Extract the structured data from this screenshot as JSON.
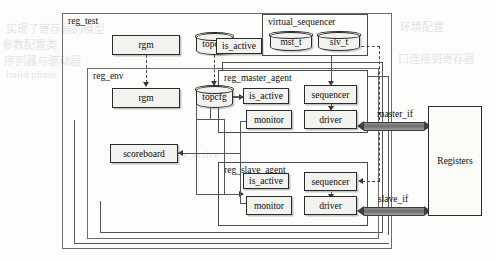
{
  "diagram": {
    "title": "reg_test",
    "containers": [
      {
        "id": "reg_test",
        "label": "reg_test"
      },
      {
        "id": "reg_env",
        "label": "reg_env"
      },
      {
        "id": "virtual_sequencer",
        "label": "virtual_sequencer"
      },
      {
        "id": "reg_master_agent",
        "label": "reg_master_agent"
      },
      {
        "id": "reg_slave_agent",
        "label": "reg_slave_agent"
      }
    ],
    "nodes": {
      "test_rgm": "rgm",
      "test_topcfg": "topcfg",
      "test_is_active": "is_active",
      "env_rgm": "rgm",
      "env_topcfg": "topcfg",
      "vseq_mst": "mst_t",
      "vseq_slv": "slv_t",
      "scoreboard": "scoreboard",
      "master_is_active": "is_active",
      "master_sequencer": "sequencer",
      "master_monitor": "monitor",
      "master_driver": "driver",
      "slave_is_active": "is_active",
      "slave_sequencer": "sequencer",
      "slave_monitor": "monitor",
      "slave_driver": "driver",
      "registers": "Registers"
    },
    "interfaces": {
      "master_if": "master_if",
      "slave_if": "slave_if"
    },
    "colors": {
      "node_fill": "#f2f2ee",
      "node_stroke": "#2b2b2b",
      "container_stroke": "#6b6b6b",
      "bus": "#6d6d6d",
      "page": "#fdfdfb"
    },
    "background_text": [
      "实现了寄存器的模型",
      "参数配置类",
      "序列器与驱动器",
      "build phase",
      "is_active",
      "环境配置",
      "口连接到寄存器"
    ]
  }
}
